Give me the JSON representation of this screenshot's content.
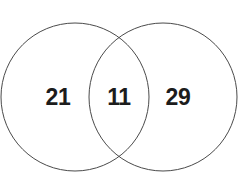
{
  "figure": {
    "type": "venn-diagram",
    "background_color": "#ffffff",
    "stroke_color": "#4a4a4a",
    "stroke_width": 1,
    "label_color": "#1c1c1c"
  },
  "chart_data": {
    "type": "table",
    "title": "",
    "xlabel": "",
    "ylabel": "",
    "diagram": "two-set-venn",
    "regions": [
      {
        "id": "left-only",
        "label": "21",
        "value": 21
      },
      {
        "id": "intersection",
        "label": "11",
        "value": 11
      },
      {
        "id": "right-only",
        "label": "29",
        "value": 29
      }
    ],
    "categories": [
      "left-only",
      "intersection",
      "right-only"
    ],
    "values": [
      21,
      11,
      29
    ],
    "sets": [
      {
        "id": "left-circle",
        "cx": 75,
        "cy": 97,
        "r": 74,
        "total": 32
      },
      {
        "id": "right-circle",
        "cx": 163,
        "cy": 97,
        "r": 74,
        "total": 40
      }
    ],
    "grid": false,
    "legend": "none"
  }
}
